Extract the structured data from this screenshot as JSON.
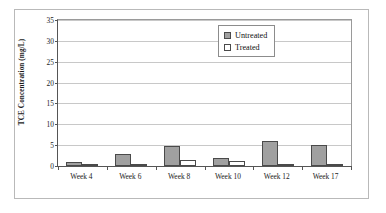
{
  "chart_data": {
    "type": "bar",
    "title": "",
    "xlabel": "",
    "ylabel": "TCE Concentration (mg/L)",
    "categories": [
      "Week 4",
      "Week 6",
      "Week 8",
      "Week 10",
      "Week 12",
      "Week 17"
    ],
    "series": [
      {
        "name": "Untreated",
        "color": "#a0a0a0",
        "values": [
          0.9,
          2.9,
          4.8,
          2.0,
          6.0,
          5.1
        ]
      },
      {
        "name": "Treated",
        "color": "#ffffff",
        "values": [
          0.2,
          0.5,
          1.4,
          1.2,
          0.3,
          0.3
        ]
      }
    ],
    "ylim": [
      0,
      35
    ],
    "yticks": [
      0,
      5,
      10,
      15,
      20,
      25,
      30,
      35
    ],
    "ytick_labels": [
      "0",
      "5",
      "10",
      "15",
      "20",
      "25",
      "30",
      "35"
    ],
    "grid": "horizontal",
    "legend_position": "top-right",
    "legend_entries": [
      "Untreated",
      "Treated"
    ],
    "annotations": []
  },
  "axis": {
    "y_title": "TCE Concentration (mg/L)"
  },
  "legend": {
    "items": [
      {
        "label": "Untreated"
      },
      {
        "label": "Treated"
      }
    ]
  }
}
